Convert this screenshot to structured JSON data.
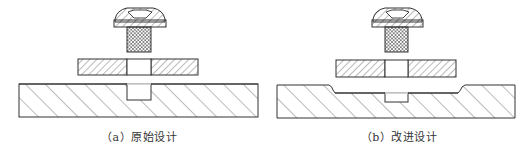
{
  "figure": {
    "panels": [
      {
        "id": "a",
        "caption": "（a）原始设计",
        "description": "Original design: screw, washer plate, flat base with blind hole"
      },
      {
        "id": "b",
        "caption": "（b）改进设计",
        "description": "Improved design: screw, washer plate, base with recessed pocket and shallower hole"
      }
    ],
    "colors": {
      "stroke": "#333333",
      "hatch": "#555555",
      "background": "#ffffff"
    }
  }
}
